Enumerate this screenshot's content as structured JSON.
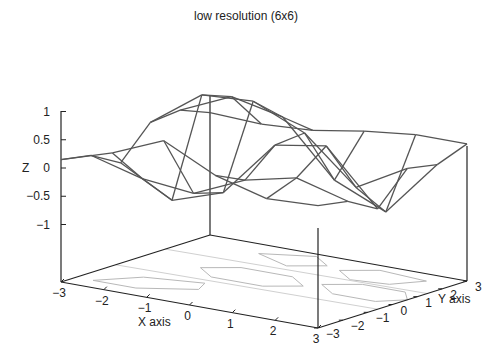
{
  "chart_data": {
    "type": "surface3d",
    "title": "low resolution (6x6)",
    "xlabel": "X axis",
    "ylabel": "Y axis",
    "zlabel": "Z",
    "xlim": [
      -3,
      3
    ],
    "ylim": [
      -3,
      3
    ],
    "zlim": [
      -1,
      1
    ],
    "xticks": [
      "-3",
      "-2",
      "-1",
      "0",
      "1",
      "2",
      "3"
    ],
    "yticks": [
      "-3",
      "-2",
      "-1",
      "0",
      "1",
      "2",
      "3"
    ],
    "zticks": [
      "-1",
      "-0.5",
      "0",
      "0.5",
      "1"
    ],
    "grid_x": [
      -3,
      -1.8,
      -0.6,
      0.6,
      1.8,
      3
    ],
    "grid_y": [
      -3,
      -1.8,
      -0.6,
      0.6,
      1.8,
      3
    ],
    "z": [
      [
        0.14,
        0.42,
        0.8,
        0.35,
        0.1,
        0.14
      ],
      [
        0.05,
        -0.2,
        -0.3,
        0.1,
        0.3,
        0.05
      ],
      [
        -0.25,
        -0.75,
        -0.45,
        0.55,
        0.7,
        -0.25
      ],
      [
        0.3,
        0.95,
        1.0,
        0.6,
        -0.2,
        0.3
      ],
      [
        0.35,
        0.75,
        0.55,
        -0.4,
        -0.8,
        0.2
      ],
      [
        0.14,
        0.1,
        0.15,
        0.3,
        0.4,
        0.4
      ]
    ],
    "contours_on_base": true,
    "colors": {
      "mesh": "#555555",
      "axes": "#222222",
      "contour": "#b8b8b8"
    }
  }
}
